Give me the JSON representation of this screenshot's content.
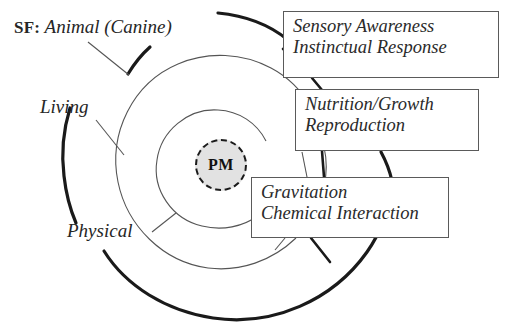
{
  "diagram": {
    "type": "concentric-hierarchy-diagram",
    "center": {
      "label": "PM",
      "shape": "dashed-circle",
      "fill_color": "#e2e2e2",
      "stroke_color": "#1a1a1a"
    },
    "header": {
      "tag": "SF:",
      "subject": "Animal (Canine)"
    },
    "ring_labels": [
      {
        "label": "Living"
      },
      {
        "label": "Physical"
      }
    ],
    "callouts": [
      {
        "name": "sensory",
        "lines": [
          "Sensory Awareness",
          "Instinctual Response"
        ]
      },
      {
        "name": "nutrition",
        "lines": [
          "Nutrition/Growth",
          "Reproduction"
        ]
      },
      {
        "name": "gravitation",
        "lines": [
          "Gravitation",
          "Chemical Interaction"
        ]
      }
    ],
    "colors": {
      "ink": "#1a1a1a",
      "thin_stroke": "#555555",
      "box_border": "#5a5a5a",
      "text": "#2b2b2b",
      "background": "#ffffff"
    }
  }
}
